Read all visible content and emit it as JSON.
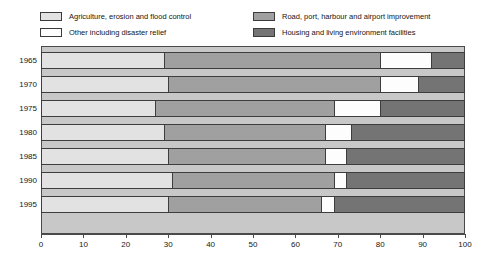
{
  "chart_data": {
    "type": "bar",
    "orientation": "horizontal",
    "stacked": true,
    "stack_mode": "percent",
    "title": "",
    "subtitle": "",
    "xlabel": "",
    "ylabel": "",
    "xlim": [
      0,
      100
    ],
    "xticks": [
      0,
      10,
      20,
      30,
      40,
      50,
      60,
      70,
      80,
      90,
      100
    ],
    "xticklabels": [
      "0",
      "10",
      "20",
      "30",
      "40",
      "50",
      "60",
      "70",
      "80",
      "90",
      "100"
    ],
    "grid": false,
    "legend_position": "top",
    "categories": [
      "1965",
      "1970",
      "1975",
      "1980",
      "1985",
      "1990",
      "1995"
    ],
    "series": [
      {
        "name": "Agriculture, erosion and flood control",
        "color": "#e2e2e2",
        "values": [
          29,
          30,
          27,
          29,
          30,
          31,
          30
        ]
      },
      {
        "name": "Road, port, harbour and airport improvement",
        "color": "#a0a0a0",
        "values": [
          51,
          50,
          42,
          38,
          37,
          38,
          36
        ]
      },
      {
        "name": "Other including disaster relief",
        "color": "#fdfdfd",
        "values": [
          12,
          9,
          11,
          6,
          5,
          3,
          3
        ]
      },
      {
        "name": "Housing and living environment facilities",
        "color": "#747474",
        "values": [
          8,
          11,
          20,
          27,
          28,
          28,
          31
        ]
      }
    ],
    "plot_background": "#c8c8c8",
    "border_color": "#3d3d3d"
  },
  "legend": {
    "entries": [
      {
        "label": "Agriculture, erosion and flood control",
        "color": "#e2e2e2"
      },
      {
        "label": "Other including disaster relief",
        "color": "#fdfdfd"
      },
      {
        "label": "Road, port, harbour and airport improvement",
        "color": "#a0a0a0"
      },
      {
        "label": "Housing and living environment facilities",
        "color": "#747474"
      }
    ]
  }
}
